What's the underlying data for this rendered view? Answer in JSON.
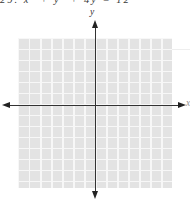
{
  "problem": {
    "number_and_equation": "29. x² + y² + 4y = 12",
    "note": "text line cropped at top edge of scan; only glyph bottoms visible"
  },
  "figure": {
    "y_axis_label": "y",
    "x_axis_label": "x",
    "colors": {
      "grid_cell": "#e3e3e3",
      "grid_gap": "#f7f7f7",
      "axis": "#333333",
      "background": "#ffffff",
      "text": "#3a3a3a"
    }
  },
  "chart_data": {
    "type": "scatter",
    "title": "",
    "xlabel": "x",
    "ylabel": "y",
    "x_range": [
      -7,
      7
    ],
    "y_range": [
      -7,
      6
    ],
    "grid": true,
    "tick_labels": "none (unlabeled graph-paper grid, cell size = 1 unit)",
    "series": []
  }
}
